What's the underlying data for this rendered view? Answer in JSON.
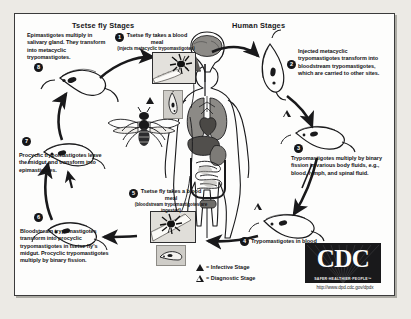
{
  "headers": {
    "tsetse": "Tsetse fly Stages",
    "human": "Human Stages"
  },
  "stages": [
    {
      "number": "1",
      "side": "tsetse",
      "text": "Tsetse fly takes a blood meal (injects metacyclic trypomastigotes)"
    },
    {
      "number": "2",
      "side": "human",
      "text": "Injected metacyclic trypomastigotes transform into bloodstream trypomastigotes, which are carried to other sites."
    },
    {
      "number": "3",
      "side": "human",
      "text": "Trypomastigotes multiply by binary fission in various body fluids, e.g., blood, lymph, and spinal fluid."
    },
    {
      "number": "4",
      "side": "human",
      "text": "Trypomastigotes in blood"
    },
    {
      "number": "5",
      "side": "tsetse",
      "text": "Tsetse fly takes a blood meal (bloodstream trypomastigotes are ingested)"
    },
    {
      "number": "6",
      "side": "tsetse",
      "text": "Bloodstream trypomastigotes transform into procyclic trypomastigotes in tsetse fly's midgut. Procyclic trypomastigotes multiply by binary fission."
    },
    {
      "number": "7",
      "side": "tsetse",
      "text": "Procyclic trypomastigotes leave the midgut and transform into epimastigotes."
    },
    {
      "number": "8",
      "side": "tsetse",
      "text": "Epimastigotes multiply in salivary gland. They transform into metacyclic trypomastigotes."
    }
  ],
  "stage1_title": "Tsetse fly takes a blood meal",
  "stage1_sub": "(injects metacyclic trypomastigotes)",
  "stage5_title": "Tsetse fly takes a blood meal",
  "stage5_sub": "(bloodstream trypomastigotes are ingested)",
  "legend": {
    "infective": "= Infective Stage",
    "diagnostic": "= Diagnostic Stage"
  },
  "branding": {
    "logo_text": "CDC",
    "tagline": "SAFER·HEALTHIER·PEOPLE™",
    "url": "http://www.dpd.cdc.gov/dpdx"
  },
  "colors": {
    "ink": "#19191b",
    "paper": "#fdfdfc",
    "backdrop": "#eceae5",
    "organ_gray": "#8c8a86",
    "box_gray": "#d9d7d2"
  }
}
